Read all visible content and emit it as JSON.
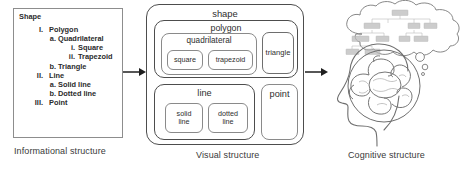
{
  "figure": {
    "arrow_icon": "right-arrow-icon"
  },
  "informational": {
    "caption": "Informational structure",
    "heading": "Shape",
    "items": [
      {
        "level": 0,
        "marker": "",
        "text": "Shape"
      },
      {
        "level": 1,
        "marker": "I.",
        "text": "Polygon"
      },
      {
        "level": 2,
        "marker": "a.",
        "text": "Quadrilateral"
      },
      {
        "level": 3,
        "marker": "i.",
        "text": "Square"
      },
      {
        "level": 3,
        "marker": "ii.",
        "text": "Trapezoid"
      },
      {
        "level": 2,
        "marker": "b.",
        "text": "Triangle"
      },
      {
        "level": 1,
        "marker": "II.",
        "text": "Line"
      },
      {
        "level": 2,
        "marker": "a.",
        "text": "Solid line"
      },
      {
        "level": 2,
        "marker": "b.",
        "text": "Dotted line"
      },
      {
        "level": 1,
        "marker": "III.",
        "text": "Point"
      }
    ]
  },
  "visual": {
    "caption": "Visual structure",
    "boxes": {
      "shape": "shape",
      "polygon": "polygon",
      "quadrilateral": "quadrilateral",
      "square": "square",
      "trapezoid": "trapezoid",
      "triangle": "triangle",
      "line": "line",
      "solid_line": "solid\nline",
      "solid_line_1": "solid",
      "solid_line_2": "line",
      "dotted_line_1": "dotted",
      "dotted_line_2": "line",
      "point": "point"
    }
  },
  "cognitive": {
    "caption": "Cognitive structure",
    "thought_bubble_icon": "thought-cloud-icon",
    "head_icon": "head-profile-icon",
    "brain_icon": "brain-icon",
    "tree_nodes": [
      "",
      "",
      "",
      "",
      "",
      "",
      "",
      "",
      "",
      "",
      "",
      ""
    ]
  },
  "colors": {
    "ink": "#2b2b2b",
    "outline_strong": "#4d4d4d",
    "outline_soft": "#8a8a8a",
    "frame": "#8d8d8d",
    "sketch": "#6f6f6f",
    "tree_fill": "#b9b9b9",
    "background": "#ffffff"
  }
}
